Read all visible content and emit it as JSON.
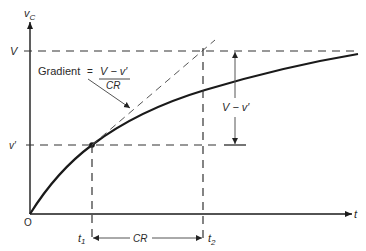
{
  "diagram": {
    "axes": {
      "y_label": "v",
      "y_label_sub": "C",
      "x_label": "t",
      "origin_label": "O"
    },
    "levels": {
      "V_label": "V",
      "v_prime_label": "v′"
    },
    "gradient_annotation": {
      "prefix": "Gradient",
      "equals": "=",
      "numerator": "V − v′",
      "denominator": "CR"
    },
    "difference_label": "V − v′",
    "time_labels": {
      "t1": "t",
      "t1_sub": "1",
      "t2": "t",
      "t2_sub": "2",
      "interval": "CR"
    },
    "colors": {
      "line": "#1a1a1a",
      "dashed": "#333333",
      "thin": "#555555"
    }
  }
}
